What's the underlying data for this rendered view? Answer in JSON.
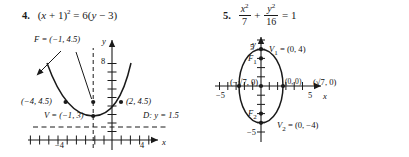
{
  "page": {
    "background": "#ffffff",
    "ink": "#1a1a1a"
  },
  "problems": [
    {
      "number": "4.",
      "equation_plain": "(x + 1)^2 = 6(y - 3)",
      "equation_parts": {
        "lhs_open": "(",
        "lhs_var": "x",
        "lhs_plus": " + ",
        "lhs_one": "1",
        "lhs_close": ")",
        "lhs_exp": "2",
        "equals": " = ",
        "rhs_coef": "6",
        "rhs_open": "(",
        "rhs_var": "y",
        "rhs_minus": " − ",
        "rhs_three": "3",
        "rhs_close": ")"
      },
      "figure": {
        "type": "parabola",
        "curve_label_focus": "F = (−1, 4.5)",
        "curve_label_vertex": "V = (−1, 3)",
        "point_left": "(−4, 4.5)",
        "point_right": "(2, 4.5)",
        "directrix": "D: y = 1.5",
        "axis_x_label": "x",
        "axis_y_label": "y",
        "x_ticks": [
          "−4",
          "4"
        ],
        "y_ticks": [
          "8"
        ],
        "points": [
          {
            "label": "(−4, 4.5)",
            "x": -4,
            "y": 4.5
          },
          {
            "label": "(2, 4.5)",
            "x": 2,
            "y": 4.5
          },
          {
            "label": "F = (−1, 4.5)",
            "x": -1,
            "y": 4.5
          },
          {
            "label": "V = (−1, 3)",
            "x": -1,
            "y": 3
          }
        ]
      }
    },
    {
      "number": "5.",
      "equation_plain": "x^2/7 + y^2/16 = 1",
      "equation_parts": {
        "t1_num_var": "x",
        "t1_num_exp": "2",
        "t1_den": "7",
        "plus": " + ",
        "t2_num_var": "y",
        "t2_num_exp": "2",
        "t2_den": "16",
        "equals": " = ",
        "rhs": "1"
      },
      "figure": {
        "type": "ellipse",
        "center_label": "(0, 0)",
        "vertex_top": "V",
        "vertex_top_sub": "1",
        "vertex_top_coords": " = (0, 4)",
        "vertex_bottom": "V",
        "vertex_bottom_sub": "2",
        "vertex_bottom_coords": " = (0, −4)",
        "focus_top": "F",
        "focus_top_sub": "1",
        "focus_bottom": "F",
        "focus_bottom_sub": "2",
        "covertex_left": "(−√7, 0)",
        "covertex_right": "(√7, 0)",
        "axis_x_label": "x",
        "axis_y_label": "y",
        "x_ticks": [
          "−5",
          "5"
        ],
        "y_ticks": [
          "5",
          "−5"
        ],
        "points": [
          {
            "label": "V1 = (0, 4)",
            "x": 0,
            "y": 4
          },
          {
            "label": "V2 = (0, -4)",
            "x": 0,
            "y": -4
          },
          {
            "label": "(-√7, 0)",
            "x": -2.6458,
            "y": 0
          },
          {
            "label": "(√7, 0)",
            "x": 2.6458,
            "y": 0
          },
          {
            "label": "F1",
            "x": 0,
            "y": 3
          },
          {
            "label": "F2",
            "x": 0,
            "y": -3
          },
          {
            "label": "(0, 0)",
            "x": 0,
            "y": 0
          }
        ]
      }
    }
  ]
}
